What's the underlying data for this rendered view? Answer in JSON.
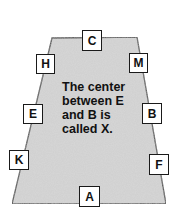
{
  "diagram": {
    "shape": "trapezoid",
    "fill_color": "#cfcfcf",
    "outline_color": "#444444",
    "caption_lines": [
      "The center",
      "between E",
      "and B is",
      "called X."
    ],
    "labels": [
      {
        "id": "C",
        "text": "C",
        "position": "top-center"
      },
      {
        "id": "H",
        "text": "H",
        "position": "left-upper"
      },
      {
        "id": "M",
        "text": "M",
        "position": "right-upper"
      },
      {
        "id": "E",
        "text": "E",
        "position": "left-middle"
      },
      {
        "id": "B",
        "text": "B",
        "position": "right-middle"
      },
      {
        "id": "K",
        "text": "K",
        "position": "left-lower"
      },
      {
        "id": "F",
        "text": "F",
        "position": "right-lower"
      },
      {
        "id": "A",
        "text": "A",
        "position": "bottom-center"
      }
    ]
  }
}
